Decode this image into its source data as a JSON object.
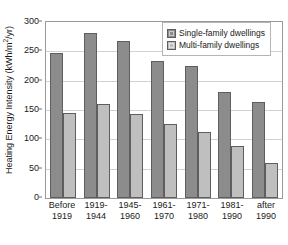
{
  "chart_data": {
    "type": "bar",
    "title": "",
    "xlabel": "",
    "ylabel": "Heating Energy Intensity (kWh/m2/yr)",
    "ylabel_parts": {
      "pre": "Heating Energy Intensity (kWh/m",
      "sup": "2",
      "post": "/yr)"
    },
    "ylim": [
      0,
      300
    ],
    "yticks": [
      0,
      50,
      100,
      150,
      200,
      250,
      300
    ],
    "ytick_labels": [
      "0",
      "50",
      "100",
      "150",
      "200",
      "250",
      "300"
    ],
    "grid": true,
    "legend_position": "top-right",
    "categories": [
      "Before 1919",
      "1919-1944",
      "1945-1960",
      "1961-1970",
      "1971-1980",
      "1981-1990",
      "after 1990"
    ],
    "category_lines": [
      [
        "Before",
        "1919"
      ],
      [
        "1919-",
        "1944"
      ],
      [
        "1945-",
        "1960"
      ],
      [
        "1961-",
        "1970"
      ],
      [
        "1971-",
        "1980"
      ],
      [
        "1981-",
        "1990"
      ],
      [
        "after",
        "1990"
      ]
    ],
    "series": [
      {
        "name": "Single-family dwellings",
        "color": "#8c8c8c",
        "values": [
          247,
          281,
          267,
          233,
          225,
          181,
          164
        ]
      },
      {
        "name": "Multi-family dwellings",
        "color": "#bfbfbf",
        "values": [
          145,
          161,
          144,
          126,
          112,
          89,
          60
        ]
      }
    ]
  },
  "legend": {
    "items": [
      {
        "label": "Single-family dwellings"
      },
      {
        "label": "Multi-family dwellings"
      }
    ]
  },
  "colors": {
    "series_0": "#8c8c8c",
    "series_1": "#bfbfbf",
    "gridline": "#d2d2d2",
    "axis": "#9a9a9a",
    "text": "#1a1a1a"
  }
}
